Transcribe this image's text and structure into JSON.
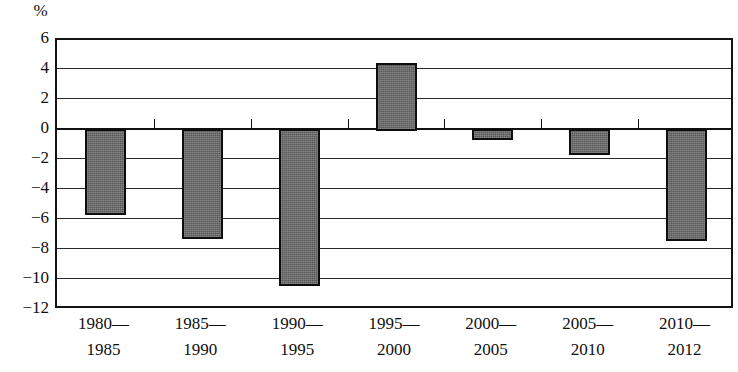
{
  "chart_data": {
    "type": "bar",
    "title": "",
    "subtitle": "",
    "xlabel": "",
    "ylabel": "%",
    "unit_label": "%",
    "categories": [
      "1980—1985",
      "1985—1990",
      "1990—1995",
      "1995—2000",
      "2000—2005",
      "2005—2010",
      "2010—2012"
    ],
    "category_lines": [
      {
        "line1": "1980—",
        "line2": "1985"
      },
      {
        "line1": "1985—",
        "line2": "1990"
      },
      {
        "line1": "1990—",
        "line2": "1995"
      },
      {
        "line1": "1995—",
        "line2": "2000"
      },
      {
        "line1": "2000—",
        "line2": "2005"
      },
      {
        "line1": "2005—",
        "line2": "2010"
      },
      {
        "line1": "2010—",
        "line2": "2012"
      }
    ],
    "values": [
      -5.6,
      -7.2,
      -10.3,
      4.4,
      -0.6,
      -1.6,
      -7.3
    ],
    "ylim": [
      -12,
      6
    ],
    "ytick_values": [
      6,
      4,
      2,
      0,
      -2,
      -4,
      -6,
      -8,
      -10,
      -12
    ],
    "ytick_labels": [
      "6",
      "4",
      "2",
      "0",
      "−2",
      "−4",
      "−6",
      "−8",
      "−10",
      "−12"
    ],
    "grid": true,
    "legend": false,
    "legend_position": "none",
    "bar_color": "#6b6b6b",
    "bar_border_color": "#0d0d0d",
    "axis_color": "#141414",
    "grid_color": "#2a2a2a",
    "background_color": "#ffffff"
  }
}
